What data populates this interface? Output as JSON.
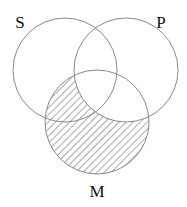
{
  "diagram": {
    "type": "venn-3",
    "circles": [
      {
        "id": "S",
        "label": "S",
        "cx": 65,
        "cy": 70,
        "r": 52,
        "label_x": 20,
        "label_y": 28
      },
      {
        "id": "P",
        "label": "P",
        "cx": 126,
        "cy": 70,
        "r": 52,
        "label_x": 161,
        "label_y": 28
      },
      {
        "id": "M",
        "label": "M",
        "cx": 97,
        "cy": 122,
        "r": 52,
        "label_x": 97,
        "label_y": 197
      }
    ],
    "shaded_region": "M minus P",
    "shading_style": "diagonal-hatch",
    "stroke_color": "#8a8a8a",
    "hatch_color": "#555555"
  }
}
